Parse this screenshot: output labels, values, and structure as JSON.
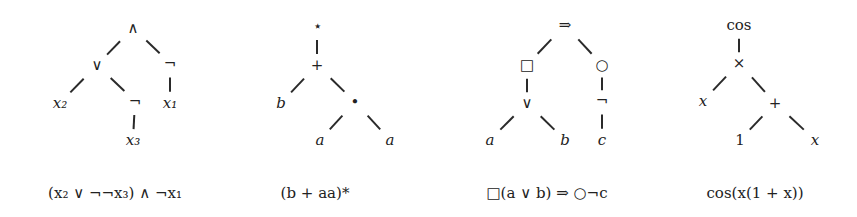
{
  "trees": [
    {
      "id": "tree-1",
      "formula": "(x₂ ∨ ¬¬x₃) ∧ ¬x₁",
      "formula_pos": [
        115,
        193
      ],
      "nodes": [
        {
          "id": "n0",
          "label": "∧",
          "x": 133,
          "y": 28,
          "italic": false
        },
        {
          "id": "n1",
          "label": "∨",
          "x": 97,
          "y": 65,
          "italic": false
        },
        {
          "id": "n2",
          "label": "¬",
          "x": 170,
          "y": 63,
          "italic": false
        },
        {
          "id": "n3",
          "label": "x₂",
          "x": 60,
          "y": 103,
          "italic": true
        },
        {
          "id": "n4",
          "label": "¬",
          "x": 135,
          "y": 101,
          "italic": false
        },
        {
          "id": "n5",
          "label": "x₁",
          "x": 170,
          "y": 103,
          "italic": true
        },
        {
          "id": "n6",
          "label": "x₃",
          "x": 133,
          "y": 140,
          "italic": true
        }
      ],
      "edges": [
        [
          "n0",
          "n1"
        ],
        [
          "n0",
          "n2"
        ],
        [
          "n1",
          "n3"
        ],
        [
          "n1",
          "n4"
        ],
        [
          "n2",
          "n5"
        ],
        [
          "n4",
          "n6"
        ]
      ]
    },
    {
      "id": "tree-2",
      "formula": "(b + aa)*",
      "formula_pos": [
        315,
        193
      ],
      "nodes": [
        {
          "id": "n0",
          "label": "⋆",
          "x": 317,
          "y": 26,
          "italic": false
        },
        {
          "id": "n1",
          "label": "+",
          "x": 317,
          "y": 65,
          "italic": false
        },
        {
          "id": "n2",
          "label": "b",
          "x": 281,
          "y": 103,
          "italic": true
        },
        {
          "id": "n3",
          "label": "•",
          "x": 355,
          "y": 102,
          "italic": false
        },
        {
          "id": "n4",
          "label": "a",
          "x": 320,
          "y": 140,
          "italic": true
        },
        {
          "id": "n5",
          "label": "a",
          "x": 390,
          "y": 140,
          "italic": true
        }
      ],
      "edges": [
        [
          "n0",
          "n1"
        ],
        [
          "n1",
          "n2"
        ],
        [
          "n1",
          "n3"
        ],
        [
          "n3",
          "n4"
        ],
        [
          "n3",
          "n5"
        ]
      ]
    },
    {
      "id": "tree-3",
      "formula": "□(a ∨ b) ⇒ ○¬c",
      "formula_pos": [
        547,
        193
      ],
      "nodes": [
        {
          "id": "n0",
          "label": "⇒",
          "x": 565,
          "y": 25,
          "italic": false
        },
        {
          "id": "n1",
          "label": "□",
          "x": 527,
          "y": 65,
          "italic": false
        },
        {
          "id": "n2",
          "label": "○",
          "x": 602,
          "y": 65,
          "italic": false
        },
        {
          "id": "n3",
          "label": "∨",
          "x": 527,
          "y": 103,
          "italic": false
        },
        {
          "id": "n4",
          "label": "¬",
          "x": 602,
          "y": 100,
          "italic": false
        },
        {
          "id": "n5",
          "label": "a",
          "x": 490,
          "y": 140,
          "italic": true
        },
        {
          "id": "n6",
          "label": "b",
          "x": 565,
          "y": 140,
          "italic": true
        },
        {
          "id": "n7",
          "label": "c",
          "x": 602,
          "y": 140,
          "italic": true
        }
      ],
      "edges": [
        [
          "n0",
          "n1"
        ],
        [
          "n0",
          "n2"
        ],
        [
          "n1",
          "n3"
        ],
        [
          "n2",
          "n4"
        ],
        [
          "n3",
          "n5"
        ],
        [
          "n3",
          "n6"
        ],
        [
          "n4",
          "n7"
        ]
      ]
    },
    {
      "id": "tree-4",
      "formula": "cos(x(1 + x))",
      "formula_pos": [
        755,
        193
      ],
      "nodes": [
        {
          "id": "n0",
          "label": "cos",
          "x": 739,
          "y": 25,
          "italic": false
        },
        {
          "id": "n1",
          "label": "×",
          "x": 739,
          "y": 63,
          "italic": false
        },
        {
          "id": "n2",
          "label": "x",
          "x": 703,
          "y": 101,
          "italic": true
        },
        {
          "id": "n3",
          "label": "+",
          "x": 775,
          "y": 103,
          "italic": false
        },
        {
          "id": "n4",
          "label": "1",
          "x": 740,
          "y": 140,
          "italic": false
        },
        {
          "id": "n5",
          "label": "x",
          "x": 815,
          "y": 140,
          "italic": true
        }
      ],
      "edges": [
        [
          "n0",
          "n1"
        ],
        [
          "n1",
          "n2"
        ],
        [
          "n1",
          "n3"
        ],
        [
          "n3",
          "n4"
        ],
        [
          "n3",
          "n5"
        ]
      ]
    }
  ],
  "style": {
    "edge_color": "#2a2a2a",
    "text_color": "#222222",
    "background": "#ffffff"
  }
}
